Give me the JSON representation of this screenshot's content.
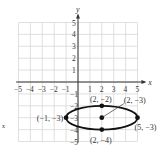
{
  "chart_data": {
    "type": "scatter",
    "title": "",
    "xlabel": "x",
    "ylabel": "y",
    "xlim": [
      -5,
      5
    ],
    "ylim": [
      -5,
      5
    ],
    "grid": true,
    "x_ticks": [
      "-5",
      "-4",
      "-3",
      "-2",
      "-1",
      "1",
      "2",
      "3",
      "4",
      "5"
    ],
    "y_ticks": [
      "5",
      "4",
      "3",
      "2",
      "1",
      "-1",
      "-2",
      "-3",
      "-4",
      "-5"
    ],
    "curve": {
      "shape": "ellipse",
      "center": [
        2,
        -3
      ],
      "semi_major_x": 3,
      "semi_minor_y": 1
    },
    "points": [
      {
        "x": -1,
        "y": -3,
        "label": "(−1, −3)"
      },
      {
        "x": 2,
        "y": -2,
        "label": "(2, −2)"
      },
      {
        "x": 2,
        "y": -3,
        "label": "(2, −3)"
      },
      {
        "x": 5,
        "y": -3,
        "label": "(5, −3)"
      },
      {
        "x": 2,
        "y": -4,
        "label": "(2, −4)"
      }
    ],
    "annotations": [
      "x"
    ]
  },
  "colors": {
    "axis": "#333333",
    "grid": "#d8d8d8",
    "curve": "#111111",
    "point": "#111111"
  }
}
